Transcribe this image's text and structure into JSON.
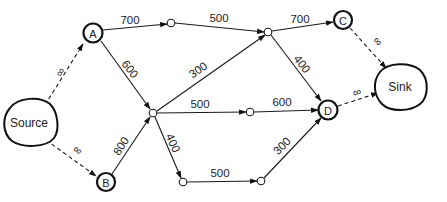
{
  "diagram": {
    "type": "flow-network",
    "nodes": {
      "source": {
        "label": "Source",
        "x": 28,
        "y": 124
      },
      "sink": {
        "label": "Sink",
        "x": 397,
        "y": 87
      },
      "a": {
        "label": "A",
        "x": 93,
        "y": 33
      },
      "b": {
        "label": "B",
        "x": 106,
        "y": 182
      },
      "c": {
        "label": "C",
        "x": 343,
        "y": 20
      },
      "d": {
        "label": "D",
        "x": 328,
        "y": 110
      },
      "j1": {
        "label": "",
        "x": 171,
        "y": 23
      },
      "j2": {
        "label": "",
        "x": 268,
        "y": 32
      },
      "hub": {
        "label": "",
        "x": 153,
        "y": 113
      },
      "j3": {
        "label": "",
        "x": 250,
        "y": 112
      },
      "j4": {
        "label": "",
        "x": 183,
        "y": 182
      },
      "j5": {
        "label": "",
        "x": 261,
        "y": 181
      }
    },
    "edges": [
      {
        "from": "source",
        "to": "a",
        "capacity": "∞",
        "style": "dashed"
      },
      {
        "from": "source",
        "to": "b",
        "capacity": "∞",
        "style": "dashed"
      },
      {
        "from": "a",
        "to": "j1",
        "capacity": "700",
        "style": "solid"
      },
      {
        "from": "a",
        "to": "hub",
        "capacity": "600",
        "style": "solid"
      },
      {
        "from": "b",
        "to": "hub",
        "capacity": "800",
        "style": "solid"
      },
      {
        "from": "j1",
        "to": "j2",
        "capacity": "500",
        "style": "solid"
      },
      {
        "from": "hub",
        "to": "j2",
        "capacity": "300",
        "style": "solid"
      },
      {
        "from": "hub",
        "to": "j3",
        "capacity": "500",
        "style": "solid"
      },
      {
        "from": "hub",
        "to": "j4",
        "capacity": "400",
        "style": "solid"
      },
      {
        "from": "j2",
        "to": "c",
        "capacity": "700",
        "style": "solid"
      },
      {
        "from": "j2",
        "to": "d",
        "capacity": "400",
        "style": "solid"
      },
      {
        "from": "j3",
        "to": "d",
        "capacity": "600",
        "style": "solid"
      },
      {
        "from": "j4",
        "to": "j5",
        "capacity": "500",
        "style": "solid"
      },
      {
        "from": "j5",
        "to": "d",
        "capacity": "300",
        "style": "solid"
      },
      {
        "from": "c",
        "to": "sink",
        "capacity": "∞",
        "style": "dashed"
      },
      {
        "from": "d",
        "to": "sink",
        "capacity": "∞",
        "style": "dashed"
      }
    ]
  },
  "labels": {
    "source": "Source",
    "sink": "Sink",
    "a": "A",
    "b": "B",
    "c": "C",
    "d": "D",
    "e_source_a": "∞",
    "e_source_b": "∞",
    "e_a_j1": "700",
    "e_a_hub": "600",
    "e_b_hub": "800",
    "e_j1_j2": "500",
    "e_hub_j2": "300",
    "e_hub_j3": "500",
    "e_hub_j4": "400",
    "e_j2_c": "700",
    "e_j2_d": "400",
    "e_j3_d": "600",
    "e_j4_j5": "500",
    "e_j5_d": "300",
    "e_c_sink": "∞",
    "e_d_sink": "∞"
  }
}
